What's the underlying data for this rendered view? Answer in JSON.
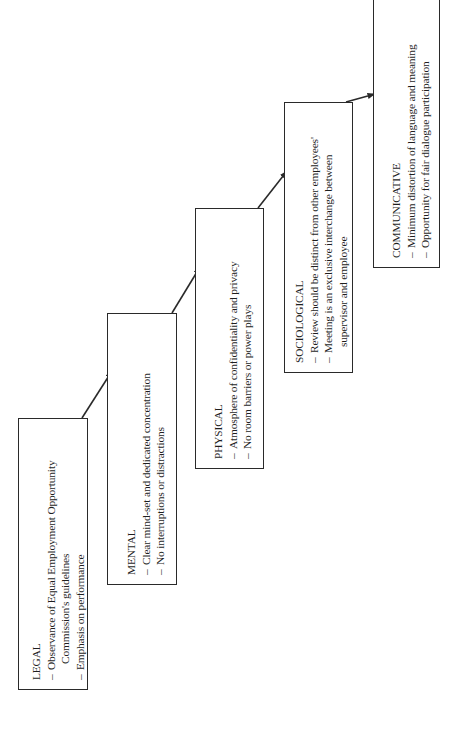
{
  "diagram": {
    "orientation": "rotated-90-ccw",
    "stages": [
      {
        "id": "legal",
        "title": "LEGAL",
        "items": [
          {
            "text": "Observance of Equal Employment Opportunity",
            "continuation": "Commission's guidelines"
          },
          {
            "text": "Emphasis on performance"
          }
        ]
      },
      {
        "id": "mental",
        "title": "MENTAL",
        "items": [
          {
            "text": "Clear mind-set and dedicated concentration"
          },
          {
            "text": "No interruptions or distractions"
          }
        ]
      },
      {
        "id": "physical",
        "title": "PHYSICAL",
        "items": [
          {
            "text": "Atmosphere of confidentiality and privacy"
          },
          {
            "text": "No room barriers or power plays"
          }
        ]
      },
      {
        "id": "sociological",
        "title": "SOCIOLOGICAL",
        "items": [
          {
            "text": "Review should be distinct from other employees'"
          },
          {
            "text": "Meeting is an exclusive interchange between",
            "continuation": "supervisor and employee"
          }
        ]
      },
      {
        "id": "communicative",
        "title": "COMMUNICATIVE",
        "items": [
          {
            "text": "Minimum distortion of language and meaning"
          },
          {
            "text": "Opportunity for fair dialogue participation"
          }
        ]
      }
    ],
    "connections": [
      {
        "from": "LEGAL",
        "to": "MENTAL"
      },
      {
        "from": "MENTAL",
        "to": "PHYSICAL"
      },
      {
        "from": "PHYSICAL",
        "to": "SOCIOLOGICAL"
      },
      {
        "from": "SOCIOLOGICAL",
        "to": "COMMUNICATIVE"
      }
    ],
    "colors": {
      "line": "#2a2a2a",
      "text": "#1e1e1e",
      "background": "#ffffff"
    }
  }
}
